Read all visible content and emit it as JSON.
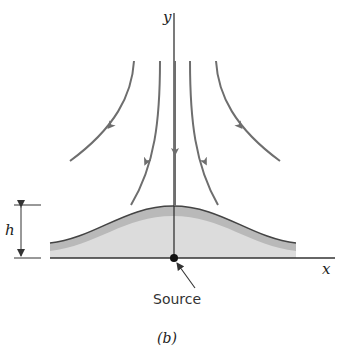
{
  "figure": {
    "caption": "(b)",
    "axis_labels": {
      "y": "y",
      "x": "x"
    },
    "dimension_label": "h",
    "source_label": "Source",
    "colors": {
      "axis": "#333333",
      "streamline": "#6e6e6e",
      "surface_outline": "#444444",
      "fill_dark": "#b9b9b9",
      "fill_light": "#dcdcdc"
    },
    "streamlines": [
      {
        "name": "outer-left"
      },
      {
        "name": "inner-left"
      },
      {
        "name": "center"
      },
      {
        "name": "inner-right"
      },
      {
        "name": "outer-right"
      }
    ]
  }
}
